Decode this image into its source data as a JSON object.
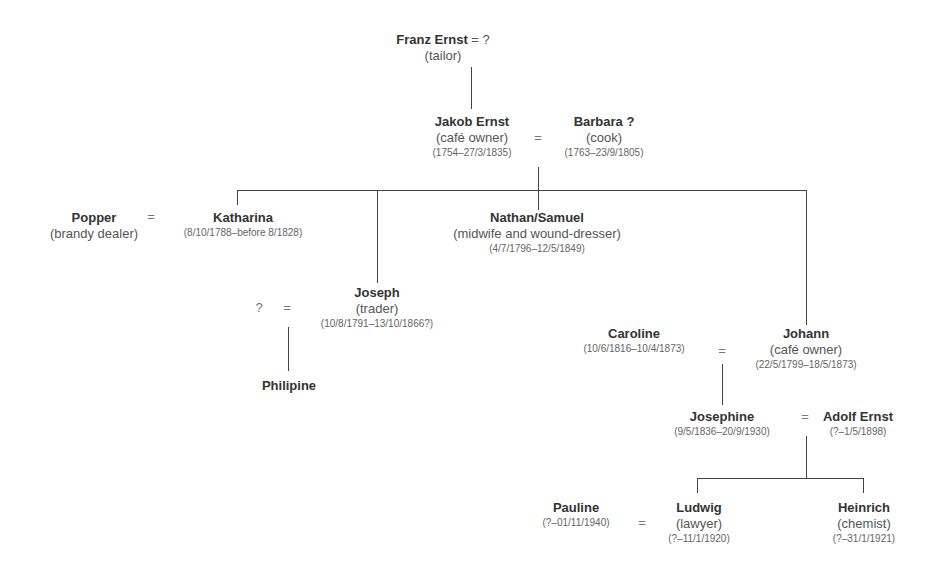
{
  "people": {
    "franz": {
      "name": "Franz Ernst",
      "spouse_suffix": " = ?",
      "occupation": "(tailor)"
    },
    "jakob": {
      "name": "Jakob Ernst",
      "occupation": "(café owner)",
      "dates": "(1754–27/3/1835)"
    },
    "barbara": {
      "name": "Barbara ?",
      "occupation": "(cook)",
      "dates": "(1763–23/9/1805)"
    },
    "popper": {
      "name": "Popper",
      "occupation": "(brandy dealer)"
    },
    "katharina": {
      "name": "Katharina",
      "dates": "(8/10/1788–before 8/1828)"
    },
    "nathan": {
      "name": "Nathan/Samuel",
      "occupation": "(midwife and wound-dresser)",
      "dates": "(4/7/1796–12/5/1849)"
    },
    "joseph": {
      "name": "Joseph",
      "occupation": "(trader)",
      "dates": "(10/8/1791–13/10/1866?)"
    },
    "joseph_spouse": {
      "name": "?"
    },
    "philipine": {
      "name": "Philipine"
    },
    "caroline": {
      "name": "Caroline",
      "dates": "(10/6/1816–10/4/1873)"
    },
    "johann": {
      "name": "Johann",
      "occupation": "(café owner)",
      "dates": "(22/5/1799–18/5/1873)"
    },
    "josephine": {
      "name": "Josephine",
      "dates": "(9/5/1836–20/9/1930)"
    },
    "adolf": {
      "name": "Adolf Ernst",
      "dates": "(?–1/5/1898)"
    },
    "pauline": {
      "name": "Pauline",
      "dates": "(?–01/11/1940)"
    },
    "ludwig": {
      "name": "Ludwig",
      "occupation": "(lawyer)",
      "dates": "(?–11/1/1920)"
    },
    "heinrich": {
      "name": "Heinrich",
      "occupation": "(chemist)",
      "dates": "(?–31/1/1921)"
    }
  },
  "symbols": {
    "marriage": "="
  }
}
